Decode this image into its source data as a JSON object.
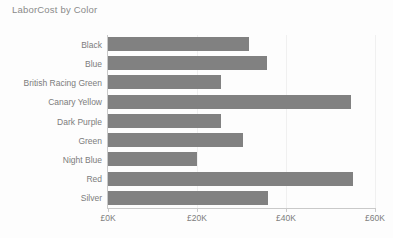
{
  "chart_data": {
    "type": "bar",
    "orientation": "horizontal",
    "title": "LaborCost by Color",
    "xlabel": "",
    "ylabel": "",
    "categories": [
      "Black",
      "Blue",
      "British Racing Green",
      "Canary Yellow",
      "Dark Purple",
      "Green",
      "Night Blue",
      "Red",
      "Silver"
    ],
    "values": [
      31700,
      35700,
      25400,
      54600,
      25400,
      30300,
      20000,
      55100,
      36000
    ],
    "value_unit": "GBP",
    "xlim": [
      0,
      60000
    ],
    "xticks": [
      0,
      20000,
      40000,
      60000
    ],
    "xtick_labels": [
      "£0K",
      "£20K",
      "£40K",
      "£60K"
    ],
    "grid": true,
    "legend": false,
    "bar_color": "#818181",
    "axis_color": "#c9c9c9",
    "gridline_color": "#f0f0f0",
    "text_color": "#7c7c7c",
    "background": "#fdfdfd"
  }
}
